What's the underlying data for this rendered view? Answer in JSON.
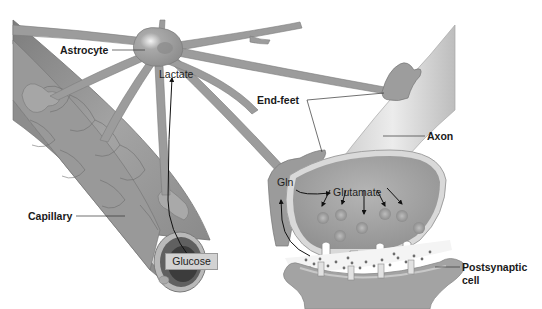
{
  "diagram": {
    "type": "neuroglia-metabolic-coupling",
    "color_scheme": "grayscale",
    "colors": {
      "background": "#ffffff",
      "tissue_dark": "#8a8a8a",
      "tissue_mid": "#a8a8a8",
      "tissue_light": "#d6d6d6",
      "label_text": "#1a1a1a",
      "leader_line": "#333333"
    }
  },
  "labels": {
    "astrocyte": "Astrocyte",
    "lactate": "Lactate",
    "end_feet": "End-feet",
    "axon": "Axon",
    "gln": "Gln",
    "glutamate": "Glutamate",
    "capillary": "Capillary",
    "glucose": "Glucose",
    "postsynaptic_line1": "Postsynaptic",
    "postsynaptic_line2": "cell"
  }
}
